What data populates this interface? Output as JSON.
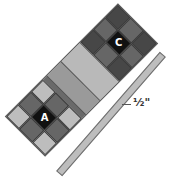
{
  "diagram": {
    "type": "quilt-strip-assembly",
    "main_strip": {
      "orientation_deg": 45,
      "sections": [
        {
          "id": "block-c",
          "kind": "nine-patch",
          "label": "C",
          "colors": {
            "corner": "#474747",
            "edge": "#666666",
            "center": "#111111"
          }
        },
        {
          "id": "band-light",
          "kind": "band",
          "color": "#b9b9b9"
        },
        {
          "id": "band-medium",
          "kind": "band",
          "color": "#9a9a9a"
        },
        {
          "id": "band-dark",
          "kind": "band",
          "color": "#6a6a6a"
        },
        {
          "id": "block-a",
          "kind": "nine-patch",
          "label": "A",
          "colors": {
            "corner": "#bdbdbd",
            "edge": "#666666",
            "center": "#111111"
          }
        }
      ]
    },
    "thin_strip": {
      "color": "#bdbdbd",
      "dimension_label": "½\""
    }
  },
  "labels": {
    "block_c": "C",
    "block_a": "A",
    "dimension": "½\""
  }
}
